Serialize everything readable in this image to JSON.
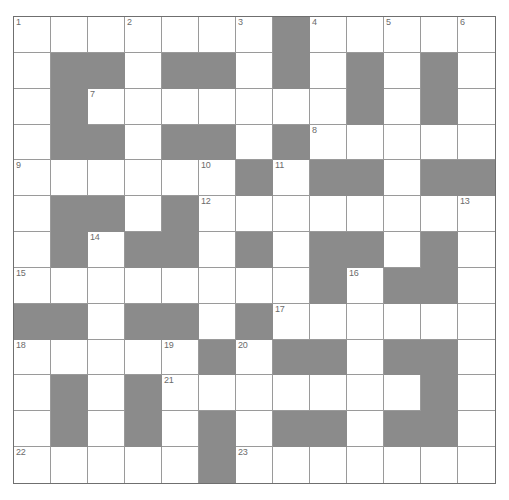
{
  "puzzle": {
    "type": "crossword-grid",
    "rows": 13,
    "columns": 13,
    "colors": {
      "block": "#8b8b8b",
      "cell": "#ffffff",
      "grid_line": "#9a9a9a",
      "outer_border": "#6f6f6f",
      "number_text": "#6b6b6b",
      "page_background": "#ffffff"
    },
    "highest_clue_number": 23,
    "grid": [
      [
        {
          "block": false,
          "num": "1"
        },
        {
          "block": false,
          "num": ""
        },
        {
          "block": false,
          "num": ""
        },
        {
          "block": false,
          "num": "2"
        },
        {
          "block": false,
          "num": ""
        },
        {
          "block": false,
          "num": ""
        },
        {
          "block": false,
          "num": "3"
        },
        {
          "block": true,
          "num": ""
        },
        {
          "block": false,
          "num": "4"
        },
        {
          "block": false,
          "num": ""
        },
        {
          "block": false,
          "num": "5"
        },
        {
          "block": false,
          "num": ""
        },
        {
          "block": false,
          "num": "6"
        }
      ],
      [
        {
          "block": false,
          "num": ""
        },
        {
          "block": true,
          "num": ""
        },
        {
          "block": true,
          "num": ""
        },
        {
          "block": false,
          "num": ""
        },
        {
          "block": true,
          "num": ""
        },
        {
          "block": true,
          "num": ""
        },
        {
          "block": false,
          "num": ""
        },
        {
          "block": true,
          "num": ""
        },
        {
          "block": false,
          "num": ""
        },
        {
          "block": true,
          "num": ""
        },
        {
          "block": false,
          "num": ""
        },
        {
          "block": true,
          "num": ""
        },
        {
          "block": false,
          "num": ""
        }
      ],
      [
        {
          "block": false,
          "num": ""
        },
        {
          "block": true,
          "num": ""
        },
        {
          "block": false,
          "num": "7"
        },
        {
          "block": false,
          "num": ""
        },
        {
          "block": false,
          "num": ""
        },
        {
          "block": false,
          "num": ""
        },
        {
          "block": false,
          "num": ""
        },
        {
          "block": false,
          "num": ""
        },
        {
          "block": false,
          "num": ""
        },
        {
          "block": true,
          "num": ""
        },
        {
          "block": false,
          "num": ""
        },
        {
          "block": true,
          "num": ""
        },
        {
          "block": false,
          "num": ""
        }
      ],
      [
        {
          "block": false,
          "num": ""
        },
        {
          "block": true,
          "num": ""
        },
        {
          "block": true,
          "num": ""
        },
        {
          "block": false,
          "num": ""
        },
        {
          "block": true,
          "num": ""
        },
        {
          "block": true,
          "num": ""
        },
        {
          "block": false,
          "num": ""
        },
        {
          "block": true,
          "num": ""
        },
        {
          "block": false,
          "num": "8"
        },
        {
          "block": false,
          "num": ""
        },
        {
          "block": false,
          "num": ""
        },
        {
          "block": false,
          "num": ""
        },
        {
          "block": false,
          "num": ""
        }
      ],
      [
        {
          "block": false,
          "num": "9"
        },
        {
          "block": false,
          "num": ""
        },
        {
          "block": false,
          "num": ""
        },
        {
          "block": false,
          "num": ""
        },
        {
          "block": false,
          "num": ""
        },
        {
          "block": false,
          "num": "10"
        },
        {
          "block": true,
          "num": ""
        },
        {
          "block": false,
          "num": "11"
        },
        {
          "block": true,
          "num": ""
        },
        {
          "block": true,
          "num": ""
        },
        {
          "block": false,
          "num": ""
        },
        {
          "block": true,
          "num": ""
        },
        {
          "block": true,
          "num": ""
        }
      ],
      [
        {
          "block": false,
          "num": ""
        },
        {
          "block": true,
          "num": ""
        },
        {
          "block": true,
          "num": ""
        },
        {
          "block": false,
          "num": ""
        },
        {
          "block": true,
          "num": ""
        },
        {
          "block": false,
          "num": "12"
        },
        {
          "block": false,
          "num": ""
        },
        {
          "block": false,
          "num": ""
        },
        {
          "block": false,
          "num": ""
        },
        {
          "block": false,
          "num": ""
        },
        {
          "block": false,
          "num": ""
        },
        {
          "block": false,
          "num": ""
        },
        {
          "block": false,
          "num": "13"
        }
      ],
      [
        {
          "block": false,
          "num": ""
        },
        {
          "block": true,
          "num": ""
        },
        {
          "block": false,
          "num": "14"
        },
        {
          "block": true,
          "num": ""
        },
        {
          "block": true,
          "num": ""
        },
        {
          "block": false,
          "num": ""
        },
        {
          "block": true,
          "num": ""
        },
        {
          "block": false,
          "num": ""
        },
        {
          "block": true,
          "num": ""
        },
        {
          "block": true,
          "num": ""
        },
        {
          "block": false,
          "num": ""
        },
        {
          "block": true,
          "num": ""
        },
        {
          "block": false,
          "num": ""
        }
      ],
      [
        {
          "block": false,
          "num": "15"
        },
        {
          "block": false,
          "num": ""
        },
        {
          "block": false,
          "num": ""
        },
        {
          "block": false,
          "num": ""
        },
        {
          "block": false,
          "num": ""
        },
        {
          "block": false,
          "num": ""
        },
        {
          "block": false,
          "num": ""
        },
        {
          "block": false,
          "num": ""
        },
        {
          "block": true,
          "num": ""
        },
        {
          "block": false,
          "num": "16"
        },
        {
          "block": true,
          "num": ""
        },
        {
          "block": true,
          "num": ""
        },
        {
          "block": false,
          "num": ""
        }
      ],
      [
        {
          "block": true,
          "num": ""
        },
        {
          "block": true,
          "num": ""
        },
        {
          "block": false,
          "num": ""
        },
        {
          "block": true,
          "num": ""
        },
        {
          "block": true,
          "num": ""
        },
        {
          "block": false,
          "num": ""
        },
        {
          "block": true,
          "num": ""
        },
        {
          "block": false,
          "num": "17"
        },
        {
          "block": false,
          "num": ""
        },
        {
          "block": false,
          "num": ""
        },
        {
          "block": false,
          "num": ""
        },
        {
          "block": false,
          "num": ""
        },
        {
          "block": false,
          "num": ""
        }
      ],
      [
        {
          "block": false,
          "num": "18"
        },
        {
          "block": false,
          "num": ""
        },
        {
          "block": false,
          "num": ""
        },
        {
          "block": false,
          "num": ""
        },
        {
          "block": false,
          "num": "19"
        },
        {
          "block": true,
          "num": ""
        },
        {
          "block": false,
          "num": "20"
        },
        {
          "block": true,
          "num": ""
        },
        {
          "block": true,
          "num": ""
        },
        {
          "block": false,
          "num": ""
        },
        {
          "block": true,
          "num": ""
        },
        {
          "block": true,
          "num": ""
        },
        {
          "block": false,
          "num": ""
        }
      ],
      [
        {
          "block": false,
          "num": ""
        },
        {
          "block": true,
          "num": ""
        },
        {
          "block": false,
          "num": ""
        },
        {
          "block": true,
          "num": ""
        },
        {
          "block": false,
          "num": "21"
        },
        {
          "block": false,
          "num": ""
        },
        {
          "block": false,
          "num": ""
        },
        {
          "block": false,
          "num": ""
        },
        {
          "block": false,
          "num": ""
        },
        {
          "block": false,
          "num": ""
        },
        {
          "block": false,
          "num": ""
        },
        {
          "block": true,
          "num": ""
        },
        {
          "block": false,
          "num": ""
        }
      ],
      [
        {
          "block": false,
          "num": ""
        },
        {
          "block": true,
          "num": ""
        },
        {
          "block": false,
          "num": ""
        },
        {
          "block": true,
          "num": ""
        },
        {
          "block": false,
          "num": ""
        },
        {
          "block": true,
          "num": ""
        },
        {
          "block": false,
          "num": ""
        },
        {
          "block": true,
          "num": ""
        },
        {
          "block": true,
          "num": ""
        },
        {
          "block": false,
          "num": ""
        },
        {
          "block": true,
          "num": ""
        },
        {
          "block": true,
          "num": ""
        },
        {
          "block": false,
          "num": ""
        }
      ],
      [
        {
          "block": false,
          "num": "22"
        },
        {
          "block": false,
          "num": ""
        },
        {
          "block": false,
          "num": ""
        },
        {
          "block": false,
          "num": ""
        },
        {
          "block": false,
          "num": ""
        },
        {
          "block": true,
          "num": ""
        },
        {
          "block": false,
          "num": "23"
        },
        {
          "block": false,
          "num": ""
        },
        {
          "block": false,
          "num": ""
        },
        {
          "block": false,
          "num": ""
        },
        {
          "block": false,
          "num": ""
        },
        {
          "block": false,
          "num": ""
        },
        {
          "block": false,
          "num": ""
        }
      ]
    ]
  }
}
